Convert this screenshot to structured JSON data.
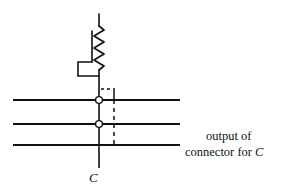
{
  "figure": {
    "type": "circuit-schematic",
    "title": "",
    "background_color": "#ffffff",
    "stroke_color": "#111111"
  },
  "labels": {
    "output_line1": "output of",
    "output_line2_prefix": "connector for ",
    "output_line2_variable": "C",
    "node_label": "C"
  },
  "components": {
    "variable_resistor": {
      "name": "variable-resistor",
      "zigzag_peaks": 6,
      "top_lead_from": [
        99,
        14
      ],
      "top_lead_to": [
        99,
        26
      ],
      "bottom_lead_from": [
        99,
        68
      ],
      "bottom_lead_to": [
        99,
        77
      ],
      "wiper_bracket": [
        [
          92,
          31
        ],
        [
          92,
          60
        ],
        [
          78,
          60
        ],
        [
          78,
          75
        ],
        [
          99,
          75
        ]
      ]
    },
    "vertical_bus": {
      "name": "vertical-bus-c",
      "x": 99,
      "y_top": 75,
      "y_bottom": 168
    },
    "horizontal_lines": [
      {
        "name": "horizontal-line-1",
        "y": 100,
        "x_start": 13,
        "x_end": 180
      },
      {
        "name": "horizontal-line-2",
        "y": 124,
        "x_start": 13,
        "x_end": 180
      },
      {
        "name": "horizontal-line-3",
        "y": 145,
        "x_start": 13,
        "x_end": 180
      }
    ],
    "junctions": [
      {
        "name": "junction-node-1",
        "cx": 99,
        "cy": 100,
        "r": 3.4
      },
      {
        "name": "junction-node-2",
        "cx": 99,
        "cy": 124,
        "r": 3.4
      }
    ],
    "dashed_path": {
      "name": "dashed-output-path",
      "horizontal_segment": {
        "y": 89,
        "x_start": 100,
        "x_end": 114
      },
      "vertical_segment": {
        "x": 114,
        "y_start": 89,
        "y_end": 146
      },
      "corner_solid": {
        "x": 114,
        "y_start": 89,
        "y_end": 100
      },
      "dash_pattern": "3,3"
    }
  }
}
